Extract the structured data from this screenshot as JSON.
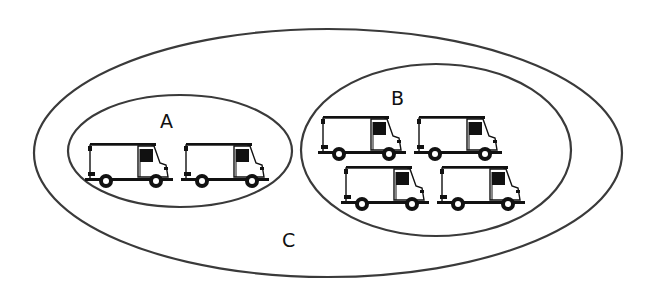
{
  "diagram": {
    "sets": [
      {
        "id": "C",
        "label": "C",
        "cx": 328,
        "cy": 153,
        "rx": 294,
        "ry": 124,
        "label_x": 282,
        "label_y": 247
      },
      {
        "id": "A",
        "label": "A",
        "cx": 180,
        "cy": 151,
        "rx": 112,
        "ry": 56,
        "label_x": 160,
        "label_y": 128
      },
      {
        "id": "B",
        "label": "B",
        "cx": 436,
        "cy": 150,
        "rx": 135,
        "ry": 86,
        "label_x": 391,
        "label_y": 105
      }
    ],
    "items": [
      {
        "set": "A",
        "icon": "delivery-van-icon",
        "x": 85,
        "y": 143
      },
      {
        "set": "A",
        "icon": "delivery-van-icon",
        "x": 181,
        "y": 143
      },
      {
        "set": "B",
        "icon": "delivery-van-icon",
        "x": 318,
        "y": 116
      },
      {
        "set": "B",
        "icon": "delivery-van-icon",
        "x": 414,
        "y": 116
      },
      {
        "set": "B",
        "icon": "delivery-van-icon",
        "x": 341,
        "y": 166
      },
      {
        "set": "B",
        "icon": "delivery-van-icon",
        "x": 437,
        "y": 166
      }
    ],
    "counts": {
      "A": 2,
      "B": 4
    },
    "stroke_color": "#3a3a3a"
  }
}
